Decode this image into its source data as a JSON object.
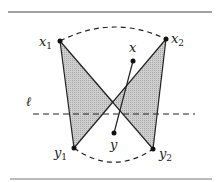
{
  "diagram": {
    "type": "geometric-figure",
    "frame": {
      "top_rule": {
        "x1": 8,
        "x2": 212,
        "y": 12
      },
      "bottom_rule": {
        "x1": 10,
        "x2": 212,
        "y": 179
      }
    },
    "points": {
      "x1": {
        "label": "x",
        "sub": "1",
        "x": 60,
        "y": 41
      },
      "x2": {
        "label": "x",
        "sub": "2",
        "x": 166,
        "y": 39
      },
      "y1": {
        "label": "y",
        "sub": "1",
        "x": 74,
        "y": 148
      },
      "y2": {
        "label": "y",
        "sub": "2",
        "x": 153,
        "y": 149
      },
      "x": {
        "label": "x",
        "sub": "",
        "x": 133,
        "y": 61
      },
      "y": {
        "label": "y",
        "sub": "",
        "x": 114,
        "y": 133
      }
    },
    "line_l": {
      "label": "ℓ",
      "x1": 33,
      "x2": 195,
      "y": 114,
      "style": "dashed"
    },
    "dashed_arcs": [
      {
        "from": "x1",
        "to": "x2",
        "style": "dashed"
      },
      {
        "from": "y1",
        "to": "y2",
        "style": "dashed"
      }
    ],
    "segments": [
      {
        "from": "x1",
        "to": "y2"
      },
      {
        "from": "x2",
        "to": "y1"
      },
      {
        "from": "x1",
        "to": "y1"
      },
      {
        "from": "x2",
        "to": "y2"
      },
      {
        "from": "x",
        "to": "y"
      }
    ],
    "shaded_regions": [
      {
        "name": "left-triangle",
        "vertices": [
          "x1",
          "y1",
          "crossing"
        ]
      },
      {
        "name": "right-triangle",
        "vertices": [
          "x2",
          "y2",
          "crossing"
        ]
      }
    ],
    "colors": {
      "stroke": "#222222",
      "fill": "#bdbdbd",
      "rule": "#444444"
    }
  }
}
